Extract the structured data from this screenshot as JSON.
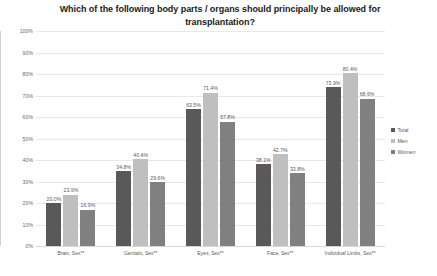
{
  "chart_data": {
    "type": "bar",
    "title": "Which of the following body parts / organs should principally be allowed for transplantation?",
    "xlabel": "",
    "ylabel": "",
    "ylim": [
      0,
      100
    ],
    "ytick_labels": [
      "100%",
      "90%",
      "80%",
      "70%",
      "60%",
      "50%",
      "40%",
      "30%",
      "20%",
      "10%",
      "0%"
    ],
    "ytick_values": [
      100,
      90,
      80,
      70,
      60,
      50,
      40,
      30,
      20,
      10,
      0
    ],
    "grid": true,
    "legend_position": "right",
    "categories": [
      "Brain, Sex**",
      "Genitals, Sex**",
      "Eyes, Sex**",
      "Face, Sex**",
      "Individual Limbs, Sex**"
    ],
    "series": [
      {
        "name": "Total",
        "color": "#595959",
        "values": [
          20.0,
          34.8,
          63.5,
          38.1,
          73.9
        ],
        "labels": [
          "20.0%",
          "34.8%",
          "63.5%",
          "38.1%",
          "73.9%"
        ]
      },
      {
        "name": "Men",
        "color": "#bfbfbf",
        "values": [
          23.9,
          40.4,
          71.4,
          42.7,
          80.4
        ],
        "labels": [
          "23.9%",
          "40.4%",
          "71.4%",
          "42.7%",
          "80.4%"
        ]
      },
      {
        "name": "Women",
        "color": "#808080",
        "values": [
          16.9,
          29.6,
          57.8,
          33.8,
          68.6
        ],
        "labels": [
          "16.9%",
          "29.6%",
          "57.8%",
          "33.8%",
          "68.6%"
        ]
      }
    ]
  }
}
